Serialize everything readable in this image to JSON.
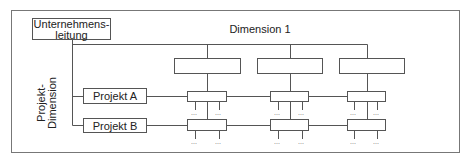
{
  "diagram": {
    "top_node": {
      "line1": "Unternehmens-",
      "line2": "leitung"
    },
    "dimension1_label": "Dimension 1",
    "project_dimension_label": "Projekt-Dimension",
    "projects": [
      {
        "label": "Projekt A"
      },
      {
        "label": "Projekt B"
      }
    ],
    "dimension1_units": [
      {
        "label": ""
      },
      {
        "label": ""
      },
      {
        "label": ""
      }
    ],
    "ellipsis": "...",
    "colors": {
      "line": "#555555",
      "frame": "#777777",
      "text": "#222222"
    }
  }
}
